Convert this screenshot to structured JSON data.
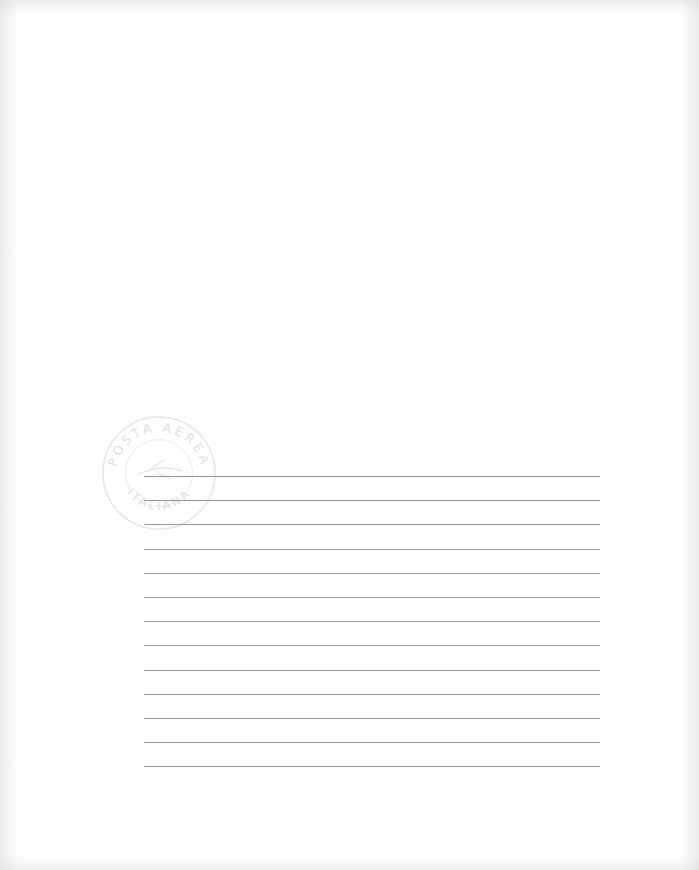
{
  "document": {
    "type": "ruled air-mail letter sheet",
    "stamp": {
      "text_top": "POSTA AEREA",
      "text_bottom": "ITALIANA",
      "color": "#c8c8c8"
    },
    "ruled_lines": {
      "count": 13,
      "start_y": 476,
      "spacing": 24.2,
      "x_start": 144,
      "x_end": 600,
      "color": "#9a9a9a"
    },
    "background": "#fefefe"
  }
}
